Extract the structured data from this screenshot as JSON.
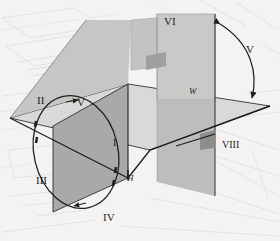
{
  "figure": {
    "background_color": "#f4f3f1",
    "ink_color": "#1b1b1b",
    "plane_colors": {
      "horizontal_plane": "#d8d8d6",
      "frontal_plane_front": "#a9a9a7",
      "frontal_plane_back": "#c3c3c1",
      "profile_plane_right": "#c9c9c7",
      "profile_plane_top": "#b6b6b4",
      "edge_line": "#1b1b1b"
    }
  },
  "labels": {
    "quadrant_1": "I",
    "quadrant_2": "II",
    "quadrant_3": "III",
    "quadrant_4": "IV",
    "rotation_arrow_left": "V",
    "plane_top_rear": "VI",
    "rotation_arrow_right": "V",
    "plane_right_lower": "VIII",
    "axis_h": "H",
    "axis_w": "W"
  },
  "annotations": {
    "ellipse_rotation": {
      "name": "rotation-ellipse",
      "description": "ellipse with arrowheads indicating rotation of quadrants",
      "arrow_count": 4
    },
    "arc_rotation": {
      "name": "rotation-arc",
      "description": "double-headed curved arrow between profile plane and horizontal plane",
      "double_headed": true
    }
  }
}
